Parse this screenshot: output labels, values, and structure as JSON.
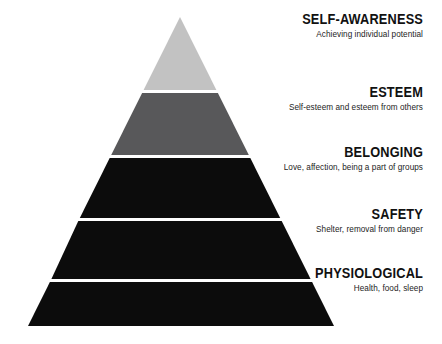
{
  "diagram": {
    "type": "pyramid",
    "name": "maslow-hierarchy-of-needs",
    "background_color": "#ffffff",
    "divider_color": "#ffffff",
    "apex": {
      "x": 180,
      "y": 17
    },
    "base_left": {
      "x": 28,
      "y": 322
    },
    "base_right": {
      "x": 334,
      "y": 322
    },
    "divider_y": [
      90,
      152,
      212,
      270
    ],
    "tiers": [
      {
        "index": 1,
        "title": "SELF-AWARENESS",
        "description": "Achieving individual potential",
        "color": "#c2c2c2"
      },
      {
        "index": 2,
        "title": "ESTEEM",
        "description": "Self-esteem and esteem from others",
        "color": "#58585a"
      },
      {
        "index": 3,
        "title": "BELONGING",
        "description": "Love, affection, being a part of groups",
        "color": "#0c0c0c"
      },
      {
        "index": 4,
        "title": "SAFETY",
        "description": "Shelter, removal from danger",
        "color": "#0c0c0c"
      },
      {
        "index": 5,
        "title": "PHYSIOLOGICAL",
        "description": "Health, food, sleep",
        "color": "#0c0c0c"
      }
    ]
  }
}
